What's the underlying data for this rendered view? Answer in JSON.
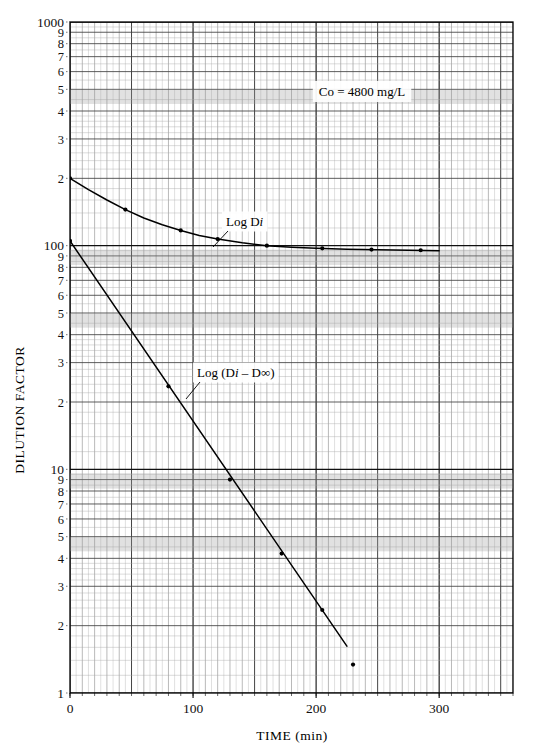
{
  "figure": {
    "axis": {
      "y_title": "DILUTION FACTOR",
      "x_title": "TIME (min)",
      "y_decade_labels": [
        "1000",
        "100",
        "10",
        "1"
      ],
      "y_minor_labels": [
        "9",
        "8",
        "7",
        "6",
        "5",
        "4",
        "3",
        "2"
      ],
      "x_tick_labels": [
        "0",
        "100",
        "200",
        "300"
      ]
    },
    "annotations": {
      "concentration": "Co = 4800 mg/L",
      "upper_curve_label_pre": "Log D",
      "upper_curve_label_ital": "i",
      "lower_curve_label_pre": "Log (D",
      "lower_curve_label_ital": "i",
      "lower_curve_label_post": " – D∞)"
    },
    "caption": ""
  },
  "chart_data": {
    "type": "line",
    "title": "",
    "xlabel": "TIME (min)",
    "ylabel": "DILUTION FACTOR",
    "xlim": [
      0,
      360
    ],
    "ylim": [
      1,
      1000
    ],
    "yscale": "log",
    "xscale": "linear",
    "grid": "semi-log graph paper (3 decades, linear x)",
    "legend": "inline curve labels",
    "xticks": [
      0,
      100,
      200,
      300
    ],
    "yticks": [
      1,
      10,
      100,
      1000
    ],
    "annotations": [
      {
        "text": "Co = 4800 mg/L",
        "x": 200,
        "y": 480
      },
      {
        "text": "Log Di",
        "x": 130,
        "y": 150
      },
      {
        "text": "Log (Di - Dinf)",
        "x": 105,
        "y": 24
      }
    ],
    "series": [
      {
        "name": "Log Di",
        "style": "curve-with-points",
        "x": [
          0,
          15,
          30,
          45,
          60,
          75,
          90,
          105,
          120,
          140,
          160,
          180,
          200,
          225,
          250,
          275,
          300
        ],
        "y": [
          200,
          178,
          160,
          145,
          133,
          124,
          117,
          111,
          107,
          103,
          100,
          98.5,
          97.5,
          96.5,
          96,
          95.5,
          95
        ],
        "markers_x": [
          0,
          45,
          90,
          120,
          160,
          205,
          245,
          285
        ],
        "markers_y": [
          200,
          145,
          117,
          107,
          100,
          97.3,
          96.1,
          95.4
        ]
      },
      {
        "name": "Log (Di - Dinf)",
        "style": "straight-line-with-points",
        "x": [
          0,
          225
        ],
        "y": [
          105,
          1.62
        ],
        "markers_x": [
          0,
          80,
          130,
          172,
          205
        ],
        "markers_y": [
          105,
          23.5,
          9.0,
          4.2,
          2.35
        ]
      },
      {
        "name": "isolated point",
        "style": "points-only",
        "markers_x": [
          230
        ],
        "markers_y": [
          1.34
        ]
      }
    ]
  }
}
